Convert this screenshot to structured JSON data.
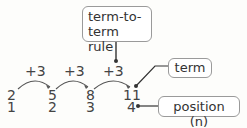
{
  "diagram": {
    "callouts": {
      "rule": "term-to-term rule",
      "rule_line1": "term-to-",
      "rule_line2": "term rule",
      "term": "term",
      "position": "position (n)"
    },
    "steps": [
      "+3",
      "+3",
      "+3"
    ],
    "terms": [
      "2",
      "5",
      "8",
      "11"
    ],
    "positions": [
      "1",
      "2",
      "3",
      "4"
    ]
  }
}
